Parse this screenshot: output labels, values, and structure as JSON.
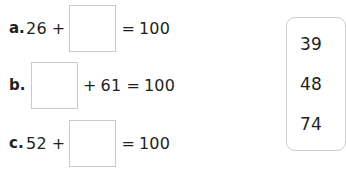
{
  "worksheet": {
    "equations": [
      {
        "label": "a.",
        "left_operand": "26",
        "plus": "+",
        "equals": "=",
        "sum": "100",
        "blank_position": "second",
        "answer_value": ""
      },
      {
        "label": "b.",
        "left_operand": "",
        "right_operand": "61",
        "plus": "+",
        "equals": "=",
        "sum": "100",
        "blank_position": "first",
        "answer_value": ""
      },
      {
        "label": "c.",
        "left_operand": "52",
        "plus": "+",
        "equals": "=",
        "sum": "100",
        "blank_position": "second",
        "answer_value": ""
      }
    ],
    "number_bank": {
      "numbers": [
        "39",
        "48",
        "74"
      ]
    },
    "colors": {
      "text": "#231f20",
      "box_border": "#c9c9c9",
      "panel_border": "#cfcfcf",
      "background": "#ffffff"
    }
  }
}
